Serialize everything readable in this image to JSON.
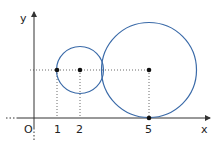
{
  "diagram": {
    "axes": {
      "x_label": "x",
      "y_label": "y",
      "origin_label": "O"
    },
    "ticks": [
      {
        "value": "1",
        "px": 57
      },
      {
        "value": "2",
        "px": 80
      },
      {
        "value": "5",
        "px": 149
      }
    ],
    "circles": [
      {
        "name": "small-circle",
        "center": [
          2,
          1.5
        ],
        "radius": 1
      },
      {
        "name": "large-circle",
        "center": [
          5,
          1.5
        ],
        "radius": 2
      }
    ],
    "points": [
      "(1, k)",
      "(2, k)",
      "(5, k)",
      "(5, 0)"
    ],
    "colors": {
      "circle": "#3a6aa8",
      "axis": "#333333"
    }
  }
}
